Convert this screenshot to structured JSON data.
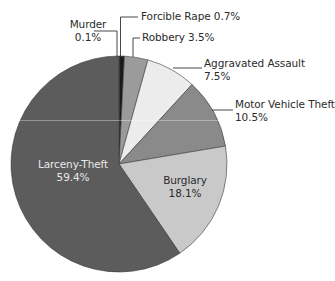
{
  "chart_data": {
    "type": "pie",
    "title": "",
    "start_angle_deg": 0,
    "direction": "clockwise",
    "center": [
      119,
      164
    ],
    "radius": 108,
    "slices": [
      {
        "label": "Murder",
        "value": 0.1,
        "display": "0.1%",
        "color": "#111111"
      },
      {
        "label": "Forcible Rape",
        "value": 0.7,
        "display": "0.7%",
        "color": "#1a1a1a"
      },
      {
        "label": "Robbery",
        "value": 3.5,
        "display": "3.5%",
        "color": "#9b9b9b"
      },
      {
        "label": "Aggravated Assault",
        "value": 7.5,
        "display": "7.5%",
        "color": "#ececec"
      },
      {
        "label": "Motor Vehicle Theft",
        "value": 10.5,
        "display": "10.5%",
        "color": "#8a8a8a"
      },
      {
        "label": "Burglary",
        "value": 18.1,
        "display": "18.1%",
        "color": "#c9c9c9"
      },
      {
        "label": "Larceny-Theft",
        "value": 59.4,
        "display": "59.4%",
        "color": "#5c5c5c"
      }
    ],
    "legend": "none (direct labels with leader lines)"
  },
  "labels": {
    "murder": {
      "name": "Murder",
      "pct": "0.1%"
    },
    "forcible_rape": {
      "text": "Forcible Rape 0.7%"
    },
    "robbery": {
      "text": "Robbery 3.5%"
    },
    "aggravated_assault": {
      "name": "Aggravated Assault",
      "pct": "7.5%"
    },
    "motor_vehicle_theft": {
      "name": "Motor Vehicle Theft",
      "pct": "10.5%"
    },
    "burglary": {
      "name": "Burglary",
      "pct": "18.1%"
    },
    "larceny_theft": {
      "name": "Larceny-Theft",
      "pct": "59.4%"
    }
  }
}
